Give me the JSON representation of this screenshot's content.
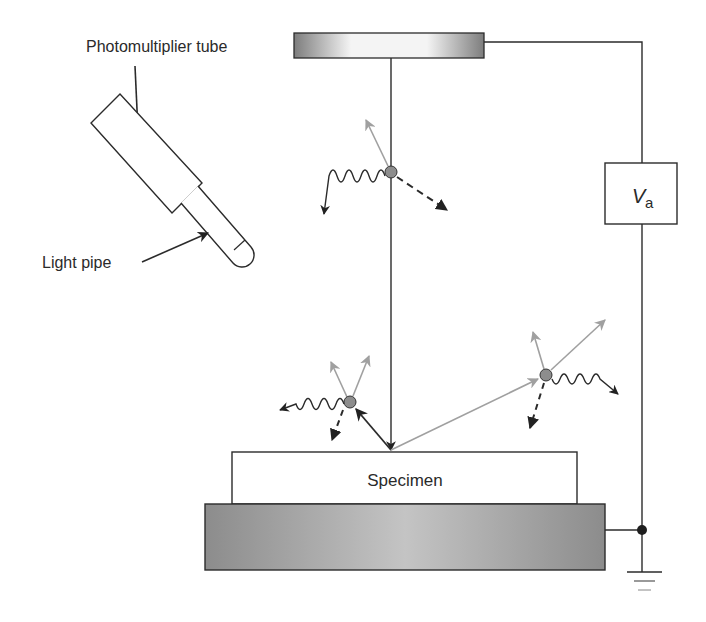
{
  "labels": {
    "photomultiplier": "Photomultiplier tube",
    "light_pipe": "Light pipe",
    "voltage_main": "V",
    "voltage_sub": "a",
    "specimen": "Specimen"
  },
  "colors": {
    "line": "#2b2b2b",
    "electron_gray": "#9a9a9a",
    "dot_fill": "#8d8d8d",
    "substrate_dark": "#8a8a8a",
    "substrate_light": "#c8c8c8"
  }
}
